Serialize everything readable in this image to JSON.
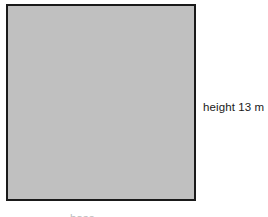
{
  "figure": {
    "type": "geometry-diagram",
    "shape": {
      "name": "shaded-rectangle",
      "fill_color": "#c0c0c0",
      "stroke_color": "#1a1a1a",
      "stroke_width_px": 2
    },
    "labels": {
      "height": "height 13 m",
      "bottom_clipped": "base"
    },
    "text_color": "#1a1a1a",
    "background_color": "#ffffff"
  }
}
